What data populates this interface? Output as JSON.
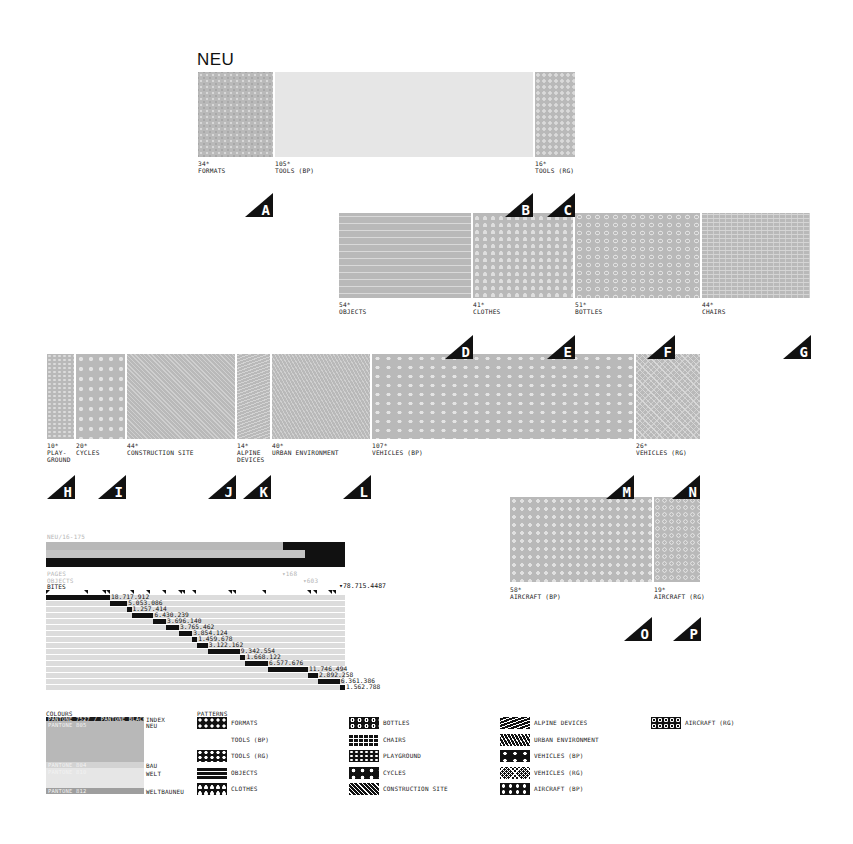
{
  "title": "NEU",
  "groups": {
    "row1": [
      {
        "count": "34*",
        "label": "FORMATS",
        "pattern": "formats",
        "marker": "A"
      },
      {
        "count": "105*",
        "label": "TOOLS (BP)",
        "pattern": "toolsbp",
        "marker": "B"
      },
      {
        "count": "16*",
        "label": "TOOLS (RG)",
        "pattern": "toolsrg",
        "marker": "C"
      }
    ],
    "row2": [
      {
        "count": "54*",
        "label": "OBJECTS",
        "pattern": "objects",
        "marker": "D"
      },
      {
        "count": "41*",
        "label": "CLOTHES",
        "pattern": "clothes",
        "marker": "E"
      },
      {
        "count": "51*",
        "label": "BOTTLES",
        "pattern": "bottles",
        "marker": "F"
      },
      {
        "count": "44*",
        "label": "CHAIRS",
        "pattern": "chairs",
        "marker": "G"
      }
    ],
    "row3": [
      {
        "count": "10*",
        "label": "PLAY-\nGROUND",
        "pattern": "playground",
        "marker": "H"
      },
      {
        "count": "20*",
        "label": "CYCLES",
        "pattern": "cycles",
        "marker": "I"
      },
      {
        "count": "44*",
        "label": "CONSTRUCTION SITE",
        "pattern": "construction",
        "marker": "J"
      },
      {
        "count": "14*",
        "label": "ALPINE\nDEVICES",
        "pattern": "alpine",
        "marker": "K"
      },
      {
        "count": "40*",
        "label": "URBAN ENVIRONMENT",
        "pattern": "urban",
        "marker": "L"
      },
      {
        "count": "107*",
        "label": "VEHICLES (BP)",
        "pattern": "vehiclesbp",
        "marker": "M"
      },
      {
        "count": "26*",
        "label": "VEHICLES (RG)",
        "pattern": "vehiclesrg",
        "marker": "N"
      }
    ],
    "row4": [
      {
        "count": "58*",
        "label": "AIRCRAFT (BP)",
        "pattern": "aircraftbp",
        "marker": "O"
      },
      {
        "count": "19*",
        "label": "AIRCRAFT (RG)",
        "pattern": "aircraftrg",
        "marker": "P"
      }
    ]
  },
  "chart": {
    "caption": "NEU/16-175",
    "pages_label": "PAGES",
    "objects_label": "OBJECTS",
    "bites_label": "BITES",
    "pages_value": "168",
    "objects_value": "603",
    "bites_total": "78.715.4487"
  },
  "chart_data": {
    "type": "bar",
    "title": "NEU/16-175",
    "summary": [
      {
        "name": "PAGES",
        "value": 168
      },
      {
        "name": "OBJECTS",
        "value": 603
      },
      {
        "name": "BITES",
        "value": 78715448
      }
    ],
    "categories": [
      "FORMATS",
      "TOOLS (BP)",
      "TOOLS (RG)",
      "OBJECTS",
      "CLOTHES",
      "BOTTLES",
      "CHAIRS",
      "PLAYGROUND",
      "CYCLES",
      "CONSTRUCTION SITE",
      "ALPINE DEVICES",
      "URBAN ENVIRONMENT",
      "VEHICLES (BP)",
      "VEHICLES (RG)",
      "AIRCRAFT (BP)",
      "AIRCRAFT (RG)"
    ],
    "values": [
      18717912,
      5053086,
      1257414,
      6430239,
      3696140,
      3765462,
      3854124,
      1459678,
      3122162,
      9342554,
      1668122,
      6577676,
      11746494,
      2892258,
      6361386,
      1562788
    ],
    "value_labels": [
      "18.717.912",
      "5.053.086",
      "1.257.414",
      "6.430.239",
      "3.696.140",
      "3.765.462",
      "3.854.124",
      "1.459.678",
      "3.122.162",
      "9.342.554",
      "1.668.122",
      "6.577.676",
      "11.746.494",
      "2.892.258",
      "6.361.386",
      "1.562.788"
    ],
    "xlabel": "",
    "ylabel": "BITES",
    "layout": "stacked waterfall; cumulative offset per row"
  },
  "legend": {
    "colours_heading": "COLOURS",
    "colours": [
      {
        "swatch": "PANTONE 7527 / PANTONE BLACK",
        "name": "INDEX",
        "color": "#1a1a1a"
      },
      {
        "swatch": "PANTONE 805",
        "name": "NEU",
        "color": "#b8b8b8"
      },
      {
        "swatch": "PANTONE 804",
        "name": "BAU",
        "color": "#d3d3d3"
      },
      {
        "swatch": "PANTONE 810",
        "name": "WELT",
        "color": "#e6e6e6"
      },
      {
        "swatch": "PANTONE 812",
        "name": "WELTBAUNEU",
        "color": "#9e9e9e"
      }
    ],
    "patterns_heading": "PATTERNS",
    "patterns": [
      {
        "name": "FORMATS",
        "pattern": "formats"
      },
      {
        "name": "TOOLS (BP)",
        "pattern": "toolsbp"
      },
      {
        "name": "TOOLS (RG)",
        "pattern": "toolsrg"
      },
      {
        "name": "OBJECTS",
        "pattern": "objects"
      },
      {
        "name": "CLOTHES",
        "pattern": "clothes"
      },
      {
        "name": "BOTTLES",
        "pattern": "bottles"
      },
      {
        "name": "CHAIRS",
        "pattern": "chairs"
      },
      {
        "name": "PLAYGROUND",
        "pattern": "playground"
      },
      {
        "name": "CYCLES",
        "pattern": "cycles"
      },
      {
        "name": "CONSTRUCTION SITE",
        "pattern": "construction"
      },
      {
        "name": "ALPINE DEVICES",
        "pattern": "alpine"
      },
      {
        "name": "URBAN ENVIRONMENT",
        "pattern": "urban"
      },
      {
        "name": "VEHICLES (BP)",
        "pattern": "vehiclesbp"
      },
      {
        "name": "VEHICLES (RG)",
        "pattern": "vehiclesrg"
      },
      {
        "name": "AIRCRAFT (BP)",
        "pattern": "aircraftbp"
      },
      {
        "name": "AIRCRAFT (RG)",
        "pattern": "aircraftrg"
      }
    ]
  },
  "colors": {
    "ink": "#111111",
    "tile": "#b9b9b9",
    "bar_track": "#dcdcdc",
    "caption": "#b5b5b5"
  }
}
